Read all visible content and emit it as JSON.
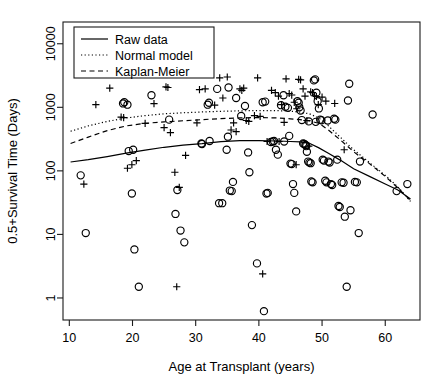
{
  "chart_data": {
    "type": "scatter",
    "title": "",
    "xlabel": "Age at Transplant (years)",
    "ylabel": "0.5+Survival Time (Days)",
    "xlim": [
      9.0,
      65.5
    ],
    "ylim": [
      0.45,
      22000
    ],
    "yscale": "log",
    "xscale": "linear",
    "grid": false,
    "xticks": [
      10,
      20,
      30,
      40,
      50,
      60
    ],
    "xticklabels": [
      "10",
      "20",
      "30",
      "40",
      "50",
      "60"
    ],
    "yticks": [
      1,
      10,
      100,
      1000,
      10000
    ],
    "yticklabels": [
      "1",
      "10",
      "100",
      "1000",
      "10000"
    ],
    "legend": {
      "position": "top-left",
      "entries": [
        {
          "label": "Raw data",
          "style": "solid",
          "name": "legend-entry-raw-data"
        },
        {
          "label": "Normal model",
          "style": "dotted",
          "name": "legend-entry-normal-model"
        },
        {
          "label": "Kaplan-Meier",
          "style": "dashed",
          "name": "legend-entry-kaplan-meier"
        }
      ]
    },
    "series": [
      {
        "name": "Censored observations",
        "marker": "circle",
        "points": [
          [
            11.8,
            85
          ],
          [
            12.6,
            10.5
          ],
          [
            18.5,
            1150
          ],
          [
            18.7,
            1200
          ],
          [
            19.4,
            205
          ],
          [
            19.9,
            44
          ],
          [
            20.3,
            5.8
          ],
          [
            21.0,
            1.5
          ],
          [
            23.0,
            1550
          ],
          [
            25.8,
            640
          ],
          [
            26.8,
            21
          ],
          [
            27.1,
            50
          ],
          [
            27.6,
            11.5
          ],
          [
            28.2,
            7.5
          ],
          [
            19.2,
            1100
          ],
          [
            20.1,
            215
          ],
          [
            31.0,
            265
          ],
          [
            32.2,
            295
          ],
          [
            33.7,
            31
          ],
          [
            34.2,
            31
          ],
          [
            34.9,
            215
          ],
          [
            35.1,
            345
          ],
          [
            35.4,
            49
          ],
          [
            35.7,
            48
          ],
          [
            35.9,
            67
          ],
          [
            31.9,
            1100
          ],
          [
            32.1,
            1180
          ],
          [
            33.4,
            1950
          ],
          [
            35.2,
            2050
          ],
          [
            36.4,
            1400
          ],
          [
            37.2,
            730
          ],
          [
            37.8,
            1050
          ],
          [
            38.3,
            195
          ],
          [
            38.5,
            95
          ],
          [
            38.9,
            14
          ],
          [
            39.7,
            3.5
          ],
          [
            40.8,
            0.62
          ],
          [
            41.2,
            44
          ],
          [
            41.4,
            45
          ],
          [
            41.9,
            285
          ],
          [
            42.2,
            290
          ],
          [
            42.4,
            295
          ],
          [
            40.6,
            1200
          ],
          [
            41.0,
            1230
          ],
          [
            42.7,
            215
          ],
          [
            43.0,
            180
          ],
          [
            43.5,
            1080
          ],
          [
            43.9,
            1550
          ],
          [
            44.2,
            1020
          ],
          [
            44.6,
            980
          ],
          [
            44.8,
            355
          ],
          [
            45.0,
            130
          ],
          [
            45.2,
            128
          ],
          [
            45.4,
            62
          ],
          [
            45.6,
            45
          ],
          [
            45.9,
            23
          ],
          [
            46.1,
            1250
          ],
          [
            46.3,
            1180
          ],
          [
            46.6,
            890
          ],
          [
            46.8,
            630
          ],
          [
            47.0,
            270
          ],
          [
            47.2,
            265
          ],
          [
            47.4,
            255
          ],
          [
            47.5,
            245
          ],
          [
            47.6,
            200
          ],
          [
            47.8,
            140
          ],
          [
            48.0,
            135
          ],
          [
            48.2,
            132
          ],
          [
            48.3,
            68
          ],
          [
            48.5,
            66
          ],
          [
            48.7,
            2650
          ],
          [
            48.9,
            2750
          ],
          [
            49.1,
            1700
          ],
          [
            49.3,
            1250
          ],
          [
            49.5,
            960
          ],
          [
            49.7,
            640
          ],
          [
            49.9,
            625
          ],
          [
            50.1,
            150
          ],
          [
            50.3,
            145
          ],
          [
            50.5,
            70
          ],
          [
            50.7,
            66
          ],
          [
            51.0,
            140
          ],
          [
            51.2,
            135
          ],
          [
            51.4,
            62
          ],
          [
            51.6,
            60
          ],
          [
            51.9,
            660
          ],
          [
            52.1,
            640
          ],
          [
            52.4,
            150
          ],
          [
            52.6,
            28
          ],
          [
            52.8,
            27
          ],
          [
            53.1,
            66
          ],
          [
            53.4,
            65
          ],
          [
            53.6,
            19
          ],
          [
            53.9,
            1.5
          ],
          [
            54.1,
            1280
          ],
          [
            54.3,
            2350
          ],
          [
            54.5,
            24
          ],
          [
            55.2,
            67
          ],
          [
            55.5,
            66
          ],
          [
            55.8,
            10.5
          ],
          [
            56.0,
            140
          ],
          [
            58.0,
            770
          ],
          [
            61.8,
            48
          ],
          [
            63.5,
            62
          ],
          [
            44.0,
            290
          ],
          [
            46.4,
            1000
          ],
          [
            47.9,
            600
          ],
          [
            49.0,
            590
          ],
          [
            50.9,
            620
          ],
          [
            30.9,
            270
          ]
        ]
      },
      {
        "name": "Deaths",
        "marker": "plus",
        "points": [
          [
            12.3,
            62
          ],
          [
            14.2,
            1100
          ],
          [
            16.4,
            2000
          ],
          [
            18.2,
            700
          ],
          [
            18.6,
            690
          ],
          [
            19.2,
            110
          ],
          [
            19.9,
            125
          ],
          [
            20.6,
            145
          ],
          [
            22.0,
            560
          ],
          [
            23.4,
            1140
          ],
          [
            25.0,
            480
          ],
          [
            25.3,
            2100
          ],
          [
            25.6,
            2050
          ],
          [
            26.0,
            400
          ],
          [
            26.7,
            95
          ],
          [
            27.0,
            1.5
          ],
          [
            27.4,
            55
          ],
          [
            28.4,
            175
          ],
          [
            30.2,
            570
          ],
          [
            30.6,
            1900
          ],
          [
            31.5,
            1950
          ],
          [
            33.0,
            1080
          ],
          [
            33.8,
            2900
          ],
          [
            34.3,
            1400
          ],
          [
            35.0,
            3000
          ],
          [
            35.6,
            440
          ],
          [
            36.0,
            570
          ],
          [
            36.4,
            415
          ],
          [
            37.0,
            1950
          ],
          [
            37.3,
            1850
          ],
          [
            37.6,
            2000
          ],
          [
            38.0,
            620
          ],
          [
            38.4,
            600
          ],
          [
            39.3,
            740
          ],
          [
            39.8,
            2900
          ],
          [
            40.2,
            720
          ],
          [
            40.6,
            2.4
          ],
          [
            41.3,
            290
          ],
          [
            42.0,
            1850
          ],
          [
            42.6,
            1700
          ],
          [
            43.1,
            1500
          ],
          [
            43.6,
            1100
          ],
          [
            44.0,
            580
          ],
          [
            44.3,
            2800
          ],
          [
            44.8,
            1650
          ],
          [
            45.2,
            1560
          ],
          [
            45.6,
            1200
          ],
          [
            45.9,
            125
          ],
          [
            46.3,
            2750
          ],
          [
            46.6,
            2700
          ],
          [
            47.0,
            1950
          ],
          [
            47.3,
            1500
          ],
          [
            47.6,
            620
          ],
          [
            47.9,
            245
          ],
          [
            48.2,
            1750
          ],
          [
            48.5,
            1700
          ],
          [
            48.8,
            1520
          ],
          [
            49.1,
            1480
          ],
          [
            49.4,
            1100
          ],
          [
            50.0,
            1450
          ],
          [
            50.6,
            1250
          ],
          [
            52.0,
            1150
          ],
          [
            53.5,
            215
          ],
          [
            46.0,
            950
          ],
          [
            43.2,
            290
          ]
        ]
      }
    ],
    "curves": [
      {
        "name": "Raw data",
        "style": "solid",
        "points": [
          [
            10.2,
            138
          ],
          [
            13.0,
            150
          ],
          [
            16.0,
            168
          ],
          [
            19.0,
            190
          ],
          [
            22.0,
            212
          ],
          [
            25.0,
            235
          ],
          [
            28.0,
            255
          ],
          [
            31.0,
            268
          ],
          [
            34.0,
            288
          ],
          [
            37.0,
            300
          ],
          [
            40.0,
            300
          ],
          [
            43.0,
            295
          ],
          [
            45.0,
            290
          ],
          [
            46.5,
            285
          ],
          [
            48.0,
            272
          ],
          [
            49.5,
            230
          ],
          [
            51.0,
            190
          ],
          [
            53.0,
            145
          ],
          [
            55.0,
            108
          ],
          [
            57.5,
            82
          ],
          [
            60.0,
            62
          ],
          [
            62.0,
            50
          ],
          [
            64.0,
            36
          ]
        ]
      },
      {
        "name": "Normal model",
        "style": "dotted",
        "points": [
          [
            10.2,
            420
          ],
          [
            13.0,
            510
          ],
          [
            16.0,
            600
          ],
          [
            19.0,
            680
          ],
          [
            22.0,
            740
          ],
          [
            25.0,
            790
          ],
          [
            28.0,
            820
          ],
          [
            31.0,
            845
          ],
          [
            34.0,
            865
          ],
          [
            37.0,
            880
          ],
          [
            40.0,
            890
          ],
          [
            43.0,
            885
          ],
          [
            45.0,
            870
          ],
          [
            46.5,
            840
          ],
          [
            48.0,
            790
          ],
          [
            49.5,
            680
          ],
          [
            51.0,
            510
          ],
          [
            53.0,
            330
          ],
          [
            55.0,
            215
          ],
          [
            57.5,
            135
          ],
          [
            60.0,
            85
          ],
          [
            62.0,
            56
          ],
          [
            64.0,
            33
          ]
        ]
      },
      {
        "name": "Kaplan-Meier",
        "style": "dashed",
        "points": [
          [
            10.2,
            270
          ],
          [
            13.0,
            340
          ],
          [
            16.0,
            430
          ],
          [
            19.0,
            510
          ],
          [
            22.0,
            560
          ],
          [
            25.0,
            590
          ],
          [
            28.0,
            615
          ],
          [
            31.0,
            640
          ],
          [
            34.0,
            665
          ],
          [
            37.0,
            680
          ],
          [
            40.0,
            690
          ],
          [
            43.0,
            680
          ],
          [
            45.0,
            660
          ],
          [
            46.5,
            640
          ],
          [
            48.0,
            610
          ],
          [
            49.5,
            560
          ],
          [
            51.0,
            440
          ],
          [
            53.0,
            300
          ],
          [
            55.0,
            200
          ],
          [
            57.5,
            130
          ],
          [
            60.0,
            82
          ],
          [
            62.0,
            54
          ],
          [
            64.0,
            34
          ]
        ]
      }
    ]
  }
}
